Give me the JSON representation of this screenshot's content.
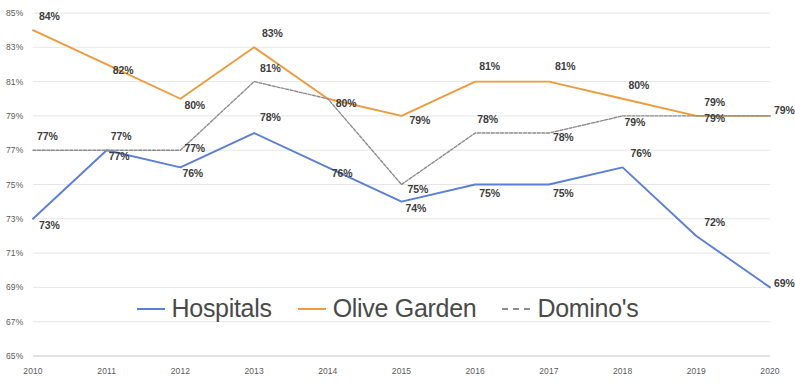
{
  "chart_data": {
    "type": "line",
    "title": "",
    "subtitle": "",
    "xlabel": "",
    "ylabel": "",
    "grid": true,
    "legend_position": "bottom",
    "categories": [
      "2010",
      "2011",
      "2012",
      "2013",
      "2014",
      "2015",
      "2016",
      "2017",
      "2018",
      "2019",
      "2020"
    ],
    "ylim": [
      65,
      85
    ],
    "ytick_step": 2,
    "ytick_labels": [
      "85%",
      "83%",
      "81%",
      "79%",
      "77%",
      "75%",
      "73%",
      "71%",
      "69%",
      "67%",
      "65%"
    ],
    "ytick_values": [
      85,
      83,
      81,
      79,
      77,
      75,
      73,
      71,
      69,
      67,
      65
    ],
    "xtick_labels": [
      "2010",
      "2011",
      "2012",
      "2013",
      "2014",
      "2015",
      "2016",
      "2017",
      "2018",
      "2019",
      "2020"
    ],
    "series": [
      {
        "name": "Hospitals",
        "color": "#5b7fd4",
        "style": "solid",
        "values": [
          73,
          77,
          76,
          78,
          76,
          74,
          75,
          75,
          76,
          72,
          69
        ],
        "labels": [
          "73%",
          "77%",
          "76%",
          "78%",
          "76%",
          "74%",
          "75%",
          "75%",
          "76%",
          "72%",
          "69%"
        ]
      },
      {
        "name": "Olive Garden",
        "color": "#ed9b3c",
        "style": "solid",
        "values": [
          84,
          82,
          80,
          83,
          80,
          79,
          81,
          81,
          80,
          79,
          79
        ],
        "labels": [
          "84%",
          "82%",
          "80%",
          "83%",
          "80%",
          "79%",
          "81%",
          "81%",
          "80%",
          "79%",
          "79%"
        ]
      },
      {
        "name": "Domino's",
        "color": "#8c8c8c",
        "style": "dashed",
        "values": [
          77,
          77,
          77,
          81,
          80,
          75,
          78,
          78,
          79,
          79,
          79
        ],
        "labels": [
          "77%",
          "77%",
          "77%",
          "81%",
          "80%",
          "75%",
          "78%",
          "78%",
          "79%",
          "79%",
          "79%"
        ]
      }
    ]
  },
  "legend": {
    "items": [
      {
        "label": "Hospitals",
        "color": "#5b7fd4"
      },
      {
        "label": "Olive Garden",
        "color": "#ed9b3c"
      },
      {
        "label": "Domino's",
        "color": "#8c8c8c"
      }
    ]
  },
  "y_axis": {
    "ticks": [
      {
        "label": "85%"
      },
      {
        "label": "83%"
      },
      {
        "label": "81%"
      },
      {
        "label": "79%"
      },
      {
        "label": "77%"
      },
      {
        "label": "75%"
      },
      {
        "label": "73%"
      },
      {
        "label": "71%"
      },
      {
        "label": "69%"
      },
      {
        "label": "67%"
      },
      {
        "label": "65%"
      }
    ]
  },
  "x_axis": {
    "ticks": [
      {
        "label": "2010"
      },
      {
        "label": "2011"
      },
      {
        "label": "2012"
      },
      {
        "label": "2013"
      },
      {
        "label": "2014"
      },
      {
        "label": "2015"
      },
      {
        "label": "2016"
      },
      {
        "label": "2017"
      },
      {
        "label": "2018"
      },
      {
        "label": "2019"
      },
      {
        "label": "2020"
      }
    ]
  },
  "point_labels": {
    "hospitals": [
      "73%",
      "77%",
      "76%",
      "78%",
      "76%",
      "74%",
      "75%",
      "75%",
      "76%",
      "72%",
      "69%"
    ],
    "olive_garden": [
      "84%",
      "82%",
      "80%",
      "83%",
      "80%",
      "79%",
      "81%",
      "81%",
      "80%",
      "79%",
      "79%"
    ],
    "dominos": [
      "77%",
      "77%",
      "77%",
      "81%",
      "80%",
      "75%",
      "78%",
      "78%",
      "79%",
      "79%",
      "79%"
    ]
  }
}
